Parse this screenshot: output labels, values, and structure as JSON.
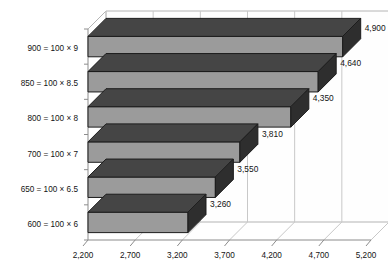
{
  "chart_data": {
    "type": "bar",
    "orientation": "horizontal",
    "style": "3d",
    "title": "",
    "subtitle": "",
    "xlabel": "",
    "ylabel": "",
    "categories": [
      "600 = 100 × 6",
      "650 = 100 × 6.5",
      "700 = 100 × 7",
      "800 = 100 × 8",
      "850 = 100 × 8.5",
      "900 = 100 × 9"
    ],
    "values": [
      3260,
      3550,
      3810,
      4350,
      4640,
      4900
    ],
    "data_labels": [
      "3,260",
      "3,550",
      "3,810",
      "4,350",
      "4,640",
      "4,900"
    ],
    "xlim": [
      2200,
      5200
    ],
    "xticks": [
      2200,
      2700,
      3200,
      3700,
      4200,
      4700,
      5200
    ],
    "xtick_labels": [
      "2,200",
      "2,700",
      "3,200",
      "3,700",
      "4,200",
      "4,700",
      "5,200"
    ],
    "grid": true,
    "grid_axis": "x",
    "legend": false,
    "legend_position": "none",
    "colors": {
      "bar_front": "#9b9b9b",
      "bar_top": "#454545",
      "bar_side": "#2e2e2e",
      "bar_outline": "#1c1c1c",
      "gridline": "#c8c8c8",
      "axis": "#8c8c8c",
      "wall": "#b4b4b4",
      "text": "#141414",
      "background": "#ffffff"
    },
    "rows": [
      {
        "category": "900 = 100 × 9",
        "value": 4900,
        "label": "4,900"
      },
      {
        "category": "850 = 100 × 8.5",
        "value": 4640,
        "label": "4,640"
      },
      {
        "category": "800 = 100 × 8",
        "value": 4350,
        "label": "4,350"
      },
      {
        "category": "700 = 100 × 7",
        "value": 3810,
        "label": "3,810"
      },
      {
        "category": "650 = 100 × 6.5",
        "value": 3550,
        "label": "3,550"
      },
      {
        "category": "600 = 100 × 6",
        "value": 3260,
        "label": "3,260"
      }
    ]
  }
}
